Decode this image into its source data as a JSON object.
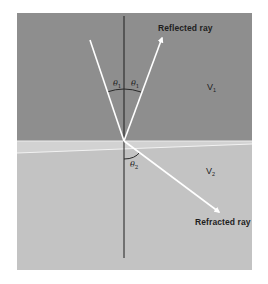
{
  "diagram": {
    "type": "ray-reflection-refraction",
    "colors": {
      "background": "#ffffff",
      "upper_medium": "#8e8e8e",
      "lower_medium": "#c3c3c3",
      "interface_band": "#d2d2d2",
      "rays": "#ffffff",
      "normal_line": "#1e1e1e",
      "arc": "#2a2a2a",
      "text": "#1e1e1e"
    },
    "panel": {
      "x": 17,
      "y": 13,
      "width": 235,
      "height": 257
    },
    "interface_y": 141,
    "normal": {
      "x": 124,
      "y_top": 16,
      "y_bottom": 258
    },
    "incident_point": {
      "x": 124,
      "y": 141
    },
    "rays": {
      "incident": {
        "x1": 90,
        "y1": 40,
        "x2": 124,
        "y2": 141
      },
      "reflected": {
        "x1": 124,
        "y1": 141,
        "x2": 162,
        "y2": 38
      },
      "refracted": {
        "x1": 124,
        "y1": 141,
        "x2": 219,
        "y2": 212
      }
    },
    "labels": {
      "reflected_ray": "Reflected ray",
      "refracted_ray": "Refracted ray",
      "theta": "θ",
      "theta1_sub": "1",
      "theta2_sub": "2",
      "v": "V",
      "v1_sub": "1",
      "v2_sub": "2"
    }
  }
}
